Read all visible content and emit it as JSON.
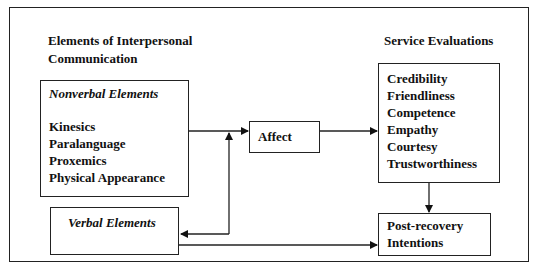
{
  "left_heading": [
    "Elements of Interpersonal",
    "Communication"
  ],
  "right_heading": "Service Evaluations",
  "nonverbal": {
    "title": "Nonverbal Elements",
    "items": [
      "Kinesics",
      "Paralanguage",
      "Proxemics",
      "Physical Appearance"
    ]
  },
  "verbal": {
    "title": "Verbal Elements"
  },
  "affect": {
    "label": "Affect"
  },
  "service_evaluations": {
    "items": [
      "Credibility",
      "Friendliness",
      "Competence",
      "Empathy",
      "Courtesy",
      "Trustworthiness"
    ]
  },
  "post_recovery": {
    "lines": [
      "Post-recovery",
      "Intentions"
    ]
  }
}
